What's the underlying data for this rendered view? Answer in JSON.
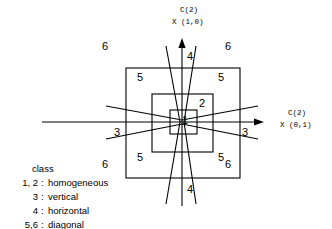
{
  "figure": {
    "axes": {
      "vertical": {
        "line1": "C(2)",
        "line2": "X (1,0)"
      },
      "horizontal": {
        "line1": "C(2)",
        "line2": "X (0,1)"
      }
    },
    "region_labels": [
      {
        "text": "6",
        "x": 105,
        "y": 47
      },
      {
        "text": "6",
        "x": 228,
        "y": 47
      },
      {
        "text": "5",
        "x": 140,
        "y": 78
      },
      {
        "text": "5",
        "x": 221,
        "y": 78
      },
      {
        "text": "4",
        "x": 182,
        "y": 57
      },
      {
        "text": "2",
        "x": 202,
        "y": 104
      },
      {
        "text": "1",
        "x": 184,
        "y": 122
      },
      {
        "text": "3",
        "x": 117,
        "y": 133
      },
      {
        "text": "3",
        "x": 245,
        "y": 133
      },
      {
        "text": "5",
        "x": 140,
        "y": 158
      },
      {
        "text": "5",
        "x": 221,
        "y": 158
      },
      {
        "text": "6",
        "x": 105,
        "y": 165
      },
      {
        "text": "6",
        "x": 228,
        "y": 165
      },
      {
        "text": "4",
        "x": 182,
        "y": 190
      }
    ],
    "legend": {
      "heading": "class",
      "rows": [
        {
          "key": "1, 2",
          "sep": ":",
          "value": "homogeneous"
        },
        {
          "key": "3",
          "sep": ":",
          "value": "vertical"
        },
        {
          "key": "4",
          "sep": ":",
          "value": "horizontal"
        },
        {
          "key": "5,6",
          "sep": ":",
          "value": "diagonal"
        }
      ]
    },
    "colors": {
      "stroke": "#000000",
      "background": "#ffffff"
    }
  }
}
